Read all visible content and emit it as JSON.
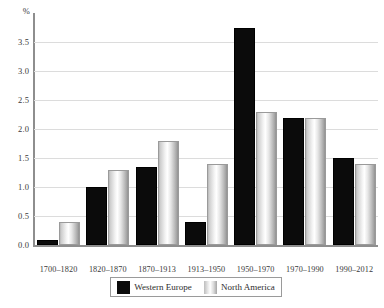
{
  "chart_data": {
    "type": "bar",
    "title": "",
    "subtitle": "",
    "xlabel": "",
    "ylabel": "%",
    "ylim": [
      0.0,
      4.0
    ],
    "ytick_labels": [
      "0.0",
      "0.5",
      "1.0",
      "1.5",
      "2.0",
      "2.5",
      "3.0",
      "3.5"
    ],
    "ytick_values": [
      0.0,
      0.5,
      1.0,
      1.5,
      2.0,
      2.5,
      3.0,
      3.5
    ],
    "grid": true,
    "legend_position": "bottom",
    "categories": [
      "1700–1820",
      "1820–1870",
      "1870–1913",
      "1913–1950",
      "1950–1970",
      "1970–1990",
      "1990–2012"
    ],
    "series": [
      {
        "name": "Western Europe",
        "color": "#0b0b0b",
        "values": [
          0.1,
          1.0,
          1.35,
          0.4,
          3.75,
          2.2,
          1.5
        ]
      },
      {
        "name": "North America",
        "color": "#c9c9c9",
        "values": [
          0.4,
          1.3,
          1.8,
          1.4,
          2.3,
          2.2,
          1.4
        ]
      }
    ]
  },
  "axis": {
    "unit_label": "%"
  },
  "legend": {
    "items": [
      {
        "label": "Western Europe",
        "swatch": "black-swatch"
      },
      {
        "label": "North America",
        "swatch": "gradient-swatch"
      }
    ]
  }
}
